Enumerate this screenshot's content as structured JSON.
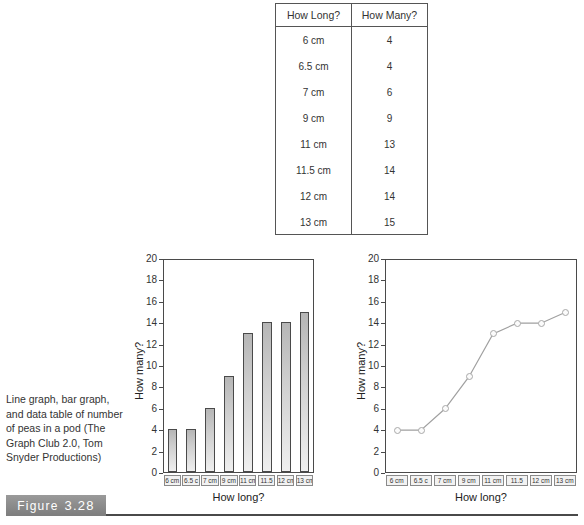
{
  "table": {
    "headers": [
      "How Long?",
      "How Many?"
    ],
    "rows": [
      [
        "6 cm",
        "4"
      ],
      [
        "6.5 cm",
        "4"
      ],
      [
        "7 cm",
        "6"
      ],
      [
        "9 cm",
        "9"
      ],
      [
        "11 cm",
        "13"
      ],
      [
        "11.5 cm",
        "14"
      ],
      [
        "12 cm",
        "14"
      ],
      [
        "13 cm",
        "15"
      ]
    ]
  },
  "caption": {
    "text": "Line graph, bar graph, and data table of number of peas in a pod (The Graph Club 2.0, Tom Snyder Productions)",
    "figure_label_word": "Figure",
    "figure_number": "3.28"
  },
  "chart_data": [
    {
      "type": "bar",
      "title": "",
      "categories": [
        "6 cm",
        "6.5 cm",
        "7 cm",
        "9 cm",
        "11 cm",
        "11.5 cm",
        "12 cm",
        "13 cm"
      ],
      "tick_labels": [
        "6 cm",
        "6.5 c",
        "7 cm",
        "9 cm",
        "11 cm",
        "11.5",
        "12 cm",
        "13 cm"
      ],
      "values": [
        4,
        4,
        6,
        9,
        13,
        14,
        14,
        15
      ],
      "xlabel": "How long?",
      "ylabel": "How many?",
      "ylim": [
        0,
        20
      ],
      "ytick_values": [
        0,
        2,
        4,
        6,
        8,
        10,
        12,
        14,
        16,
        18,
        20
      ],
      "grid": false,
      "legend": "none",
      "bar_fill": "#cfcfcf",
      "bar_border": "#4a4a4a"
    },
    {
      "type": "line",
      "title": "",
      "categories": [
        "6 cm",
        "6.5 cm",
        "7 cm",
        "9 cm",
        "11 cm",
        "11.5 cm",
        "12 cm",
        "13 cm"
      ],
      "tick_labels": [
        "6 cm",
        "6.5 c",
        "7 cm",
        "9 cm",
        "11 cm",
        "11.5",
        "12 cm",
        "13 cm"
      ],
      "values": [
        4,
        4,
        6,
        9,
        13,
        14,
        14,
        15
      ],
      "xlabel": "How long?",
      "ylabel": "How many?",
      "ylim": [
        0,
        20
      ],
      "ytick_values": [
        0,
        2,
        4,
        6,
        8,
        10,
        12,
        14,
        16,
        18,
        20
      ],
      "grid": false,
      "legend": "none",
      "line_color": "#a0a0a0",
      "marker_color": "#fbfbfb"
    }
  ]
}
